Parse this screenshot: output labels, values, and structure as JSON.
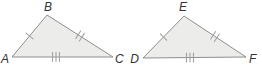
{
  "figure": {
    "triangle_abc": {
      "label_a": "A",
      "label_b": "B",
      "label_c": "C",
      "ticks_ab": 1,
      "ticks_bc": 2,
      "ticks_ac": 3
    },
    "triangle_def": {
      "label_d": "D",
      "label_e": "E",
      "label_f": "F",
      "ticks_de": 1,
      "ticks_ef": 2,
      "ticks_df": 3
    },
    "colors": {
      "triangle_fill": "#ececea",
      "triangle_stroke": "#8e8e8e",
      "tick_stroke": "#a3a3a3",
      "label_color": "#333333",
      "background": "#ffffff"
    }
  }
}
